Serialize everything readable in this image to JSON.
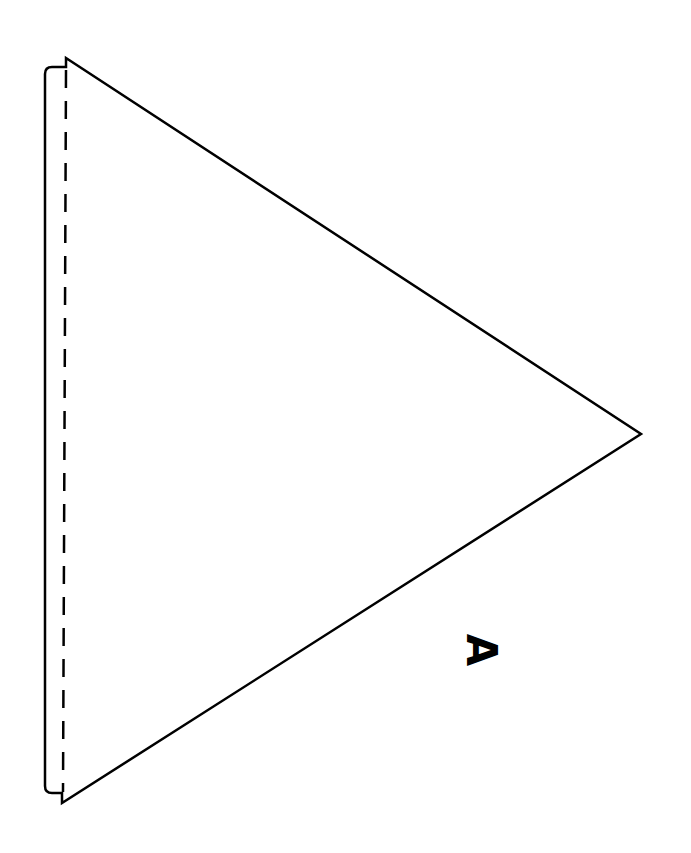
{
  "diagram": {
    "label": "A",
    "stroke_color": "#000000",
    "background": "#ffffff",
    "shape": {
      "top_vertex": [
        66,
        58
      ],
      "bottom_vertex": [
        62,
        803
      ],
      "tip_vertex": [
        641,
        434
      ],
      "tab_outer_x": 45,
      "fold_line_x": 66
    }
  }
}
